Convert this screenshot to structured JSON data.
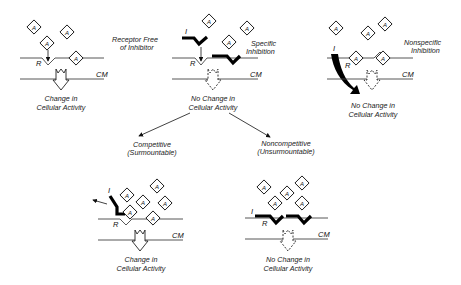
{
  "figure": {
    "agonist_symbol": "A",
    "receptor_symbol": "R",
    "inhibitor_symbol": "I",
    "membrane_label": "CM"
  },
  "panels": {
    "free": {
      "title_line1": "Receptor Free",
      "title_line2": "of Inhibitor",
      "outcome_line1": "Change in",
      "outcome_line2": "Cellular Activity"
    },
    "specific": {
      "title_line1": "Specific",
      "title_line2": "Inhibition",
      "outcome_line1": "No Change in",
      "outcome_line2": "Cellular Activity"
    },
    "nonspecific": {
      "title_line1": "Nonspecific",
      "title_line2": "Inhibition",
      "outcome_line1": "No Change in",
      "outcome_line2": "Cellular Activity"
    },
    "competitive": {
      "title_line1": "Competitive",
      "title_line2": "(Surmountable)",
      "outcome_line1": "Change in",
      "outcome_line2": "Cellular Activity"
    },
    "noncompetitive": {
      "title_line1": "Noncompetitive",
      "title_line2": "(Unsurmountable)",
      "outcome_line1": "No Change in",
      "outcome_line2": "Cellular Activity"
    }
  }
}
